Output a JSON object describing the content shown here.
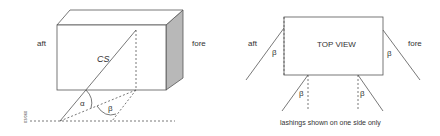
{
  "left_view": {
    "label_aft": "aft",
    "label_fore": "fore",
    "label_cs": "CS",
    "label_alpha": "α",
    "label_beta": "β",
    "side_code": "03/060"
  },
  "right_view": {
    "label_aft": "aft",
    "label_fore": "fore",
    "title": "TOP VIEW",
    "beta_labels": [
      "β",
      "β",
      "β",
      "β"
    ],
    "caption": "lashings shown on one side only"
  },
  "colors": {
    "line": "#555555",
    "side_face": "#b8b8b8",
    "text": "#333333"
  }
}
